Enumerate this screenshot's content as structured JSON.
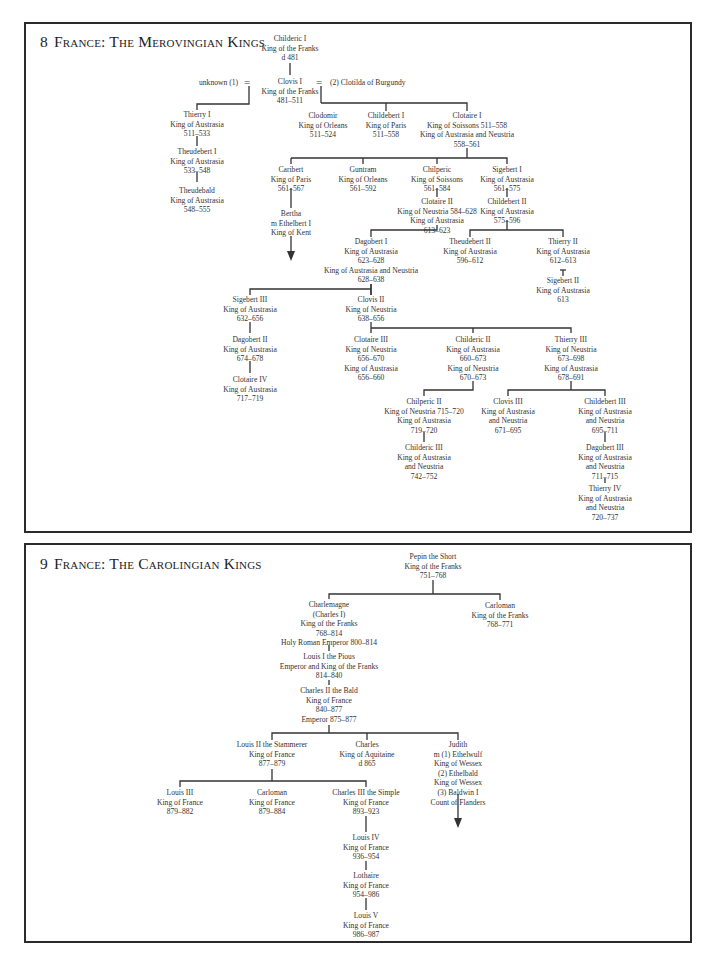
{
  "chart1": {
    "number": "8",
    "title": "France: The Merovingian Kings",
    "spouse_left": "unknown (1)",
    "spouse_right": "(2) Clotilda of Burgundy",
    "marriage_symbol": "=",
    "nodes": {
      "childeric1": [
        "Childeric I",
        "King of the Franks",
        "d 481"
      ],
      "clovis1": [
        "Clovis I",
        "King of the Franks",
        "481–511"
      ],
      "thierry1": [
        "Thierry I",
        "King of Austrasia",
        "511–533"
      ],
      "theudebert1": [
        "Theudebert I",
        "King of Austrasia",
        "533–548"
      ],
      "theudebald": [
        "Theudebald",
        "King of Austrasia",
        "548–555"
      ],
      "clodomir": [
        "Clodomir",
        "King of Orleans",
        "511–524"
      ],
      "childebert1": [
        "Childebert I",
        "King of Paris",
        "511–558"
      ],
      "clotaire1": [
        "Clotaire I",
        "King of Soissons 511–558",
        "King of Austrasia and Neustria",
        "558–561"
      ],
      "caribert": [
        "Caribert",
        "King of Paris",
        "561–567"
      ],
      "guntram": [
        "Guntram",
        "King of Orleans",
        "561–592"
      ],
      "chilperic": [
        "Chilperic",
        "King of Soissons",
        "561–584"
      ],
      "sigebert1": [
        "Sigebert I",
        "King of Austrasia",
        "561–575"
      ],
      "bertha": [
        "Bertha",
        "m Ethelbert I",
        "King of Kent"
      ],
      "clotaire2": [
        "Clotaire II",
        "King of Neustria 584–628",
        "King of Austrasia",
        "613–623"
      ],
      "childebert2": [
        "Childebert II",
        "King of Austrasia",
        "575–596"
      ],
      "dagobert1": [
        "Dagobert I",
        "King of Austrasia",
        "623–628",
        "King of Austrasia and Neustria",
        "628–638"
      ],
      "theudebert2": [
        "Theudebert II",
        "King of Austrasia",
        "596–612"
      ],
      "thierry2": [
        "Thierry II",
        "King of Austrasia",
        "612–613"
      ],
      "sigebert2": [
        "Sigebert II",
        "King of Austrasia",
        "613"
      ],
      "sigebert3": [
        "Sigebert III",
        "King of Austrasia",
        "632–656"
      ],
      "clovis2": [
        "Clovis II",
        "King of Neustria",
        "638–656"
      ],
      "dagobert2": [
        "Dagobert II",
        "King of Austrasia",
        "674–678"
      ],
      "clotaire4": [
        "Clotaire IV",
        "King of Austrasia",
        "717–719"
      ],
      "clotaire3": [
        "Clotaire III",
        "King of Neustria",
        "656–670",
        "King of Austrasia",
        "656–660"
      ],
      "childeric2": [
        "Childeric II",
        "King of Austrasia",
        "660–673",
        "King of Neustria",
        "670–673"
      ],
      "thierry3": [
        "Thierry III",
        "King of Neustria",
        "673–698",
        "King of Austrasia",
        "678–691"
      ],
      "chilperic2": [
        "Chilperic II",
        "King of Neustria 715–720",
        "King of Austrasia",
        "719–720"
      ],
      "clovis3": [
        "Clovis III",
        "King of Austrasia",
        "and Neustria",
        "671–695"
      ],
      "childebert3": [
        "Childebert III",
        "King of Austrasia",
        "and Neustria",
        "695–711"
      ],
      "childeric3": [
        "Childeric III",
        "King of Austrasia",
        "and Neustria",
        "742–752"
      ],
      "dagobert3": [
        "Dagobert III",
        "King of Austrasia",
        "and Neustria",
        "711–715"
      ],
      "thierry4": [
        "Thierry IV",
        "King of Austrasia",
        "and Neustria",
        "720–737"
      ]
    }
  },
  "chart2": {
    "number": "9",
    "title": "France: The Carolingian Kings",
    "nodes": {
      "pepin": [
        "Pepin the Short",
        "King of the Franks",
        "751–768"
      ],
      "charlemagne": [
        "Charlemagne",
        "(Charles I)",
        "King of the Franks",
        "768–814",
        "Holy Roman Emperor 800–814"
      ],
      "carloman1": [
        "Carloman",
        "King of the Franks",
        "768–771"
      ],
      "louis1": [
        "Louis I the Pious",
        "Emperor and King of the Franks",
        "814–840"
      ],
      "charles2": [
        "Charles II the Bald",
        "King of France",
        "840–877",
        "Emperor 875–877"
      ],
      "louis2": [
        "Louis II the Stammerer",
        "King of France",
        "877–879"
      ],
      "charles_aq": [
        "Charles",
        "King of Aquitaine",
        "d 865"
      ],
      "judith": [
        "Judith",
        "m (1) Ethelwulf",
        "King of Wessex",
        "(2) Ethelbald",
        "King of Wessex",
        "(3) Baldwin I",
        "Count of Flanders"
      ],
      "louis3": [
        "Louis III",
        "King of France",
        "879–882"
      ],
      "carloman2": [
        "Carloman",
        "King of France",
        "879–884"
      ],
      "charles3": [
        "Charles III the Simple",
        "King of France",
        "893–923"
      ],
      "louis4": [
        "Louis IV",
        "King of France",
        "936–954"
      ],
      "lothaire": [
        "Lothaire",
        "King of France",
        "954–986"
      ],
      "louis5": [
        "Louis V",
        "King of France",
        "986–987"
      ]
    }
  }
}
